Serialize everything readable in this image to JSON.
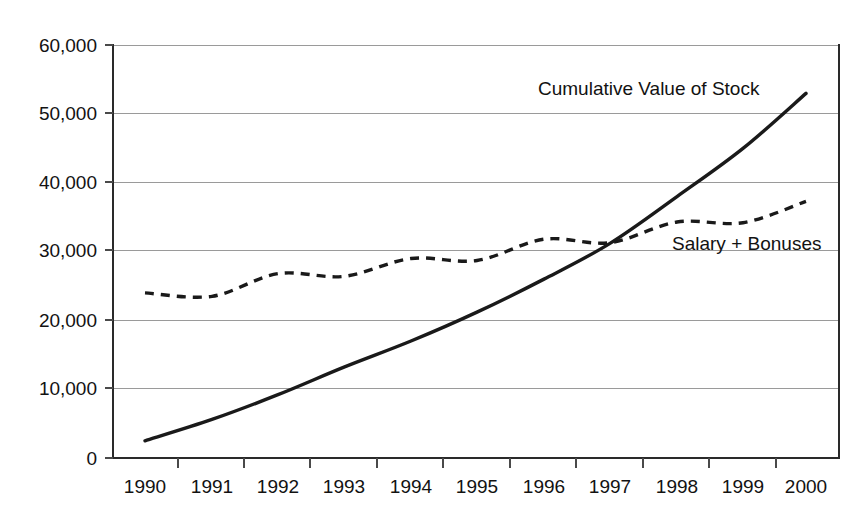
{
  "chart_data": {
    "type": "line",
    "title": "",
    "xlabel": "",
    "ylabel": "",
    "categories": [
      "1990",
      "1991",
      "1992",
      "1993",
      "1994",
      "1995",
      "1996",
      "1997",
      "1998",
      "1999",
      "2000"
    ],
    "x": [
      1990,
      1991,
      1992,
      1993,
      1994,
      1995,
      1996,
      1997,
      1998,
      1999,
      2000
    ],
    "ylim": [
      0,
      60000
    ],
    "xlim": [
      1990,
      2000
    ],
    "yticks": [
      0,
      10000,
      20000,
      30000,
      40000,
      50000,
      60000
    ],
    "ytick_labels": [
      "0",
      "10,000",
      "20,000",
      "30,000",
      "40,000",
      "50,000",
      "60,000"
    ],
    "grid": true,
    "legend": "inline-annotations",
    "series": [
      {
        "name": "Cumulative Value of Stock",
        "style": "solid",
        "values": [
          2500,
          5600,
          9200,
          13200,
          17000,
          21200,
          26000,
          31200,
          38000,
          45000,
          53000
        ]
      },
      {
        "name": "Salary + Bonuses",
        "style": "dashed",
        "values": [
          24000,
          23500,
          26800,
          26400,
          29000,
          28700,
          31800,
          31300,
          34300,
          34200,
          37300
        ]
      }
    ],
    "annotations": [
      {
        "text": "Cumulative Value of Stock",
        "x": 1996.5,
        "y": 55500
      },
      {
        "text": "Salary + Bonuses",
        "x": 1998.1,
        "y": 29300
      }
    ]
  },
  "axes": {
    "y_labels": [
      "60,000",
      "50,000",
      "40,000",
      "30,000",
      "20,000",
      "10,000",
      "0"
    ],
    "x_labels": [
      "1990",
      "1991",
      "1992",
      "1993",
      "1994",
      "1995",
      "1996",
      "1997",
      "1998",
      "1999",
      "2000"
    ]
  },
  "annotations": {
    "stock_label": "Cumulative Value of Stock",
    "salary_label": "Salary + Bonuses"
  },
  "colors": {
    "line": "#1a1a1a",
    "grid": "#9a9a9a",
    "axis": "#2a2a2a",
    "background": "#ffffff",
    "text": "#121212"
  }
}
